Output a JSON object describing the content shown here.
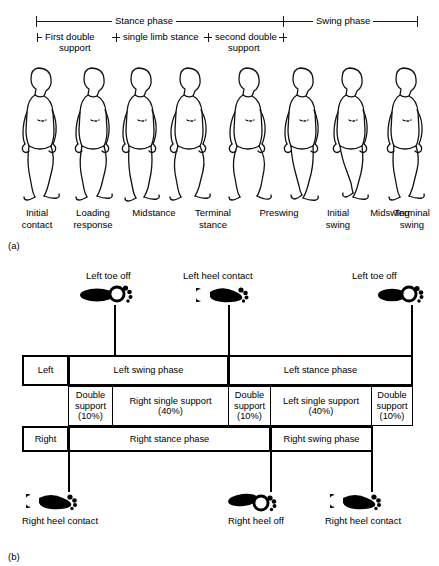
{
  "figure_a": {
    "tag": "(a)",
    "top_scale": {
      "stance_label": "Stance phase",
      "swing_label": "Swing phase",
      "sub_brackets": [
        {
          "label": "First double\nsupport",
          "line1": "First double",
          "line2": "support"
        },
        {
          "label": "single limb stance",
          "line1": "single limb stance",
          "line2": ""
        },
        {
          "label": "second double\nsupport",
          "line1": "second double",
          "line2": "support"
        }
      ]
    },
    "phases": [
      {
        "line1": "Initial",
        "line2": "contact"
      },
      {
        "line1": "Loading",
        "line2": "response"
      },
      {
        "line1": "Midstance",
        "line2": ""
      },
      {
        "line1": "Terminal",
        "line2": "stance"
      },
      {
        "line1": "Preswing",
        "line2": ""
      },
      {
        "line1": "Initial",
        "line2": "swing"
      },
      {
        "line1": "Midswing",
        "line2": ""
      },
      {
        "line1": "Terminal",
        "line2": "swing"
      }
    ]
  },
  "figure_b": {
    "tag": "(b)",
    "top_events": [
      {
        "label": "Left toe off",
        "icon": "foot-toe-off-icon"
      },
      {
        "label": "Left heel contact",
        "icon": "foot-heel-contact-icon"
      },
      {
        "label": "Left toe off",
        "icon": "foot-toe-off-icon"
      }
    ],
    "bottom_events": [
      {
        "label": "Right heel contact",
        "icon": "foot-heel-contact-icon"
      },
      {
        "label": "Right heel off",
        "icon": "foot-heel-off-icon"
      },
      {
        "label": "Right heel contact",
        "icon": "foot-heel-contact-icon"
      }
    ],
    "left_row": {
      "side_label": "Left",
      "cells": [
        {
          "text": "Left swing phase"
        },
        {
          "text": "Left stance phase"
        }
      ]
    },
    "support_row": {
      "cells": [
        {
          "line1": "Double",
          "line2": "support",
          "line3": "(10%)",
          "percent": 10
        },
        {
          "line1": "Right single support",
          "line2": "(40%)",
          "line3": "",
          "percent": 40
        },
        {
          "line1": "Double",
          "line2": "support",
          "line3": "(10%)",
          "percent": 10
        },
        {
          "line1": "Left single support",
          "line2": "(40%)",
          "line3": "",
          "percent": 40
        },
        {
          "line1": "Double",
          "line2": "support",
          "line3": "(10%)",
          "percent": 10
        }
      ]
    },
    "right_row": {
      "side_label": "Right",
      "cells": [
        {
          "text": "Right stance phase"
        },
        {
          "text": "Right swing phase"
        }
      ]
    }
  }
}
